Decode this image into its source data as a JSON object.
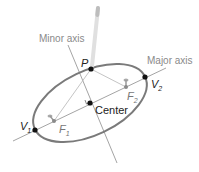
{
  "figure": {
    "labels": {
      "minor_axis": "Minor axis",
      "major_axis": "Major axis",
      "center": "Center",
      "p": "P",
      "v1": "V",
      "v1_sub": "1",
      "v2": "V",
      "v2_sub": "2",
      "f1": "F",
      "f1_sub": "1",
      "f2": "F",
      "f2_sub": "2"
    },
    "colors": {
      "ellipse": "#7a7a7a",
      "axes": "#9a9a9a",
      "points": "#111111",
      "pencil": "#d8d8d8",
      "focal_lines": "#b0b0b0"
    },
    "points": {
      "center": [
        90,
        103
      ],
      "v1": [
        35,
        130
      ],
      "v2": [
        145,
        77
      ],
      "p": [
        91,
        69
      ],
      "f1": [
        54,
        121
      ],
      "f2": [
        126,
        87
      ]
    }
  }
}
